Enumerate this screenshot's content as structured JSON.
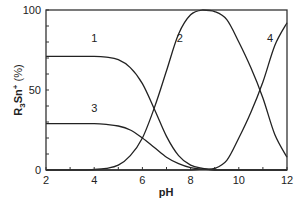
{
  "chart_data": {
    "type": "line",
    "title": "",
    "xlabel": "pH",
    "ylabel": "R3Sn+ (%)",
    "ylabel_parts": {
      "base": "R",
      "sub": "3",
      "mid": "Sn",
      "sup": "+",
      "tail": " (%)"
    },
    "xlim": [
      2,
      12
    ],
    "ylim": [
      0,
      100
    ],
    "x_ticks": [
      2,
      4,
      6,
      8,
      10,
      12
    ],
    "x_minor_ticks": [
      3,
      5,
      7,
      9,
      11
    ],
    "y_ticks": [
      0,
      50,
      100
    ],
    "y_minor_ticks": [
      10,
      20,
      30,
      40,
      60,
      70,
      80,
      90
    ],
    "grid": false,
    "legend": "none (curves labeled inline 1-4)",
    "x": [
      2.0,
      2.5,
      3.0,
      3.5,
      4.0,
      4.5,
      5.0,
      5.5,
      6.0,
      6.5,
      7.0,
      7.5,
      8.0,
      8.5,
      9.0,
      9.5,
      10.0,
      10.5,
      11.0,
      11.5,
      12.0
    ],
    "series": [
      {
        "name": "1",
        "values": [
          71,
          71,
          71,
          71,
          71,
          70.5,
          69,
          64,
          54,
          38,
          21,
          9,
          3,
          1,
          0,
          0,
          0,
          0,
          0,
          0,
          0
        ]
      },
      {
        "name": "2",
        "values": [
          0,
          0,
          0,
          0,
          0.3,
          1,
          3,
          9,
          20,
          39,
          62,
          85,
          97,
          100,
          99,
          94,
          80,
          64,
          45,
          22,
          8
        ]
      },
      {
        "name": "3",
        "values": [
          29,
          29,
          29,
          29,
          29,
          28.5,
          27.5,
          25,
          20,
          14,
          8,
          4,
          1.5,
          0.5,
          0,
          0,
          0,
          0,
          0,
          0,
          0
        ]
      },
      {
        "name": "4",
        "values": [
          0,
          0,
          0,
          0,
          0,
          0,
          0,
          0,
          0,
          0,
          0,
          0,
          0,
          0.5,
          1,
          6,
          20,
          36,
          55,
          78,
          92
        ]
      }
    ],
    "curve_labels": [
      {
        "text": "1",
        "x": 4.0,
        "y": 80
      },
      {
        "text": "2",
        "x": 7.55,
        "y": 80
      },
      {
        "text": "3",
        "x": 4.0,
        "y": 36
      },
      {
        "text": "4",
        "x": 11.3,
        "y": 80
      }
    ]
  }
}
